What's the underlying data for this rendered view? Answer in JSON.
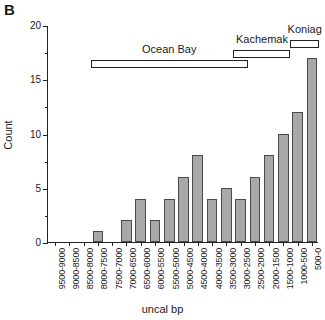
{
  "panel": {
    "letter": "B"
  },
  "chart_data": {
    "type": "bar",
    "title": "",
    "xlabel": "uncal bp",
    "ylabel": "Count",
    "ylim": [
      0,
      20
    ],
    "ytick_values": [
      0,
      5,
      10,
      15,
      20
    ],
    "ytick_labels": [
      "0",
      "5",
      "10",
      "15",
      "20"
    ],
    "yminor_values": [
      2.5,
      7.5,
      12.5,
      17.5
    ],
    "grid": false,
    "legend": "none",
    "categories": [
      "9500-9000",
      "9000-8500",
      "8500-8000",
      "8000-7500",
      "7500-7000",
      "7000-6500",
      "6500-6000",
      "6000-5500",
      "5500-5000",
      "5000-4500",
      "4500-4000",
      "4000-3500",
      "3500-3000",
      "3000-2500",
      "2500-2000",
      "2000-1500",
      "1500-1000",
      "1000-500",
      "500-0"
    ],
    "values": [
      0,
      0,
      0,
      1,
      0,
      2,
      4,
      2,
      4,
      6,
      8,
      4,
      5,
      4,
      6,
      8,
      10,
      12,
      17
    ],
    "annotations": [
      {
        "name": "Ocean Bay",
        "start_category": "8000-7500",
        "end_category": "3000-2500",
        "label_align": "center"
      },
      {
        "name": "Kachemak",
        "start_category": "3000-2500",
        "end_category": "1500-1000",
        "label_align": "center"
      },
      {
        "name": "Koniag",
        "start_category": "1000-500",
        "end_category": "500-0",
        "label_align": "center"
      }
    ]
  },
  "colors": {
    "bar_fill": "#a8a8a8",
    "bar_stroke": "#4a4a4a",
    "axis": "#222222",
    "background": "#ffffff"
  }
}
